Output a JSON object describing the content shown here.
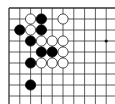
{
  "board": {
    "description": "Cropped top-left corner of a Go board",
    "origin_x": 9,
    "origin_y": 8,
    "spacing_x": 10.8,
    "spacing_y": 11,
    "visible_cols": 10,
    "visible_rows": 9,
    "line_color": "#333333",
    "background": "#ffffff",
    "star_points": [
      {
        "col": 9,
        "row": 3
      }
    ],
    "stones": [
      {
        "color": "white",
        "col": 2,
        "row": 1
      },
      {
        "color": "black",
        "col": 3,
        "row": 1
      },
      {
        "color": "white",
        "col": 5,
        "row": 1
      },
      {
        "color": "black",
        "col": 1,
        "row": 2
      },
      {
        "color": "white",
        "col": 2,
        "row": 2
      },
      {
        "color": "black",
        "col": 3,
        "row": 2
      },
      {
        "color": "black",
        "col": 2,
        "row": 3
      },
      {
        "color": "white",
        "col": 3,
        "row": 3
      },
      {
        "color": "white",
        "col": 4,
        "row": 3
      },
      {
        "color": "white",
        "col": 5,
        "row": 3
      },
      {
        "color": "black",
        "col": 3,
        "row": 4
      },
      {
        "color": "black",
        "col": 4,
        "row": 4
      },
      {
        "color": "white",
        "col": 5,
        "row": 4
      },
      {
        "color": "black",
        "col": 2,
        "row": 5
      },
      {
        "color": "white",
        "col": 3,
        "row": 5
      },
      {
        "color": "white",
        "col": 4,
        "row": 5
      },
      {
        "color": "white",
        "col": 5,
        "row": 5
      },
      {
        "color": "black",
        "col": 2,
        "row": 7
      }
    ]
  }
}
